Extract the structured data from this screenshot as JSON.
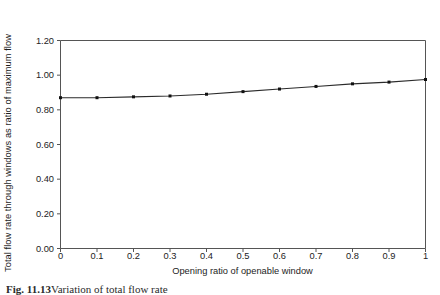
{
  "figure": {
    "caption_label": "Fig. 11.13",
    "caption_text": "Variation of total flow rate"
  },
  "chart_data": {
    "type": "line",
    "title": "",
    "subtitle": "",
    "xlabel": "Opening ratio of openable window",
    "ylabel": "Total flow rate through windows as ratio of maximum flow",
    "x": [
      0,
      0.1,
      0.2,
      0.3,
      0.4,
      0.5,
      0.6,
      0.7,
      0.8,
      0.9,
      1
    ],
    "values": [
      0.87,
      0.87,
      0.875,
      0.88,
      0.89,
      0.905,
      0.92,
      0.935,
      0.95,
      0.96,
      0.975
    ],
    "series": [
      {
        "name": "Total flow rate ratio",
        "values": [
          0.87,
          0.87,
          0.875,
          0.88,
          0.89,
          0.905,
          0.92,
          0.935,
          0.95,
          0.96,
          0.975
        ]
      }
    ],
    "xlim": [
      0,
      1
    ],
    "ylim": [
      0,
      1.2
    ],
    "xticks": [
      0,
      0.1,
      0.2,
      0.3,
      0.4,
      0.5,
      0.6,
      0.7,
      0.8,
      0.9,
      1
    ],
    "xtick_labels": [
      "0",
      "0.1",
      "0.2",
      "0.3",
      "0.4",
      "0.5",
      "0.6",
      "0.7",
      "0.8",
      "0.9",
      "1"
    ],
    "yticks": [
      0,
      0.2,
      0.4,
      0.6,
      0.8,
      1.0,
      1.2
    ],
    "ytick_labels": [
      "0.00",
      "0.20",
      "0.40",
      "0.60",
      "0.80",
      "1.00",
      "1.20"
    ],
    "grid": false,
    "legend": false,
    "legend_position": "none",
    "marker": "square",
    "line_color": "#2b2b2b",
    "marker_color": "#111111",
    "axis_color": "#555555",
    "background_color": "#ffffff"
  }
}
